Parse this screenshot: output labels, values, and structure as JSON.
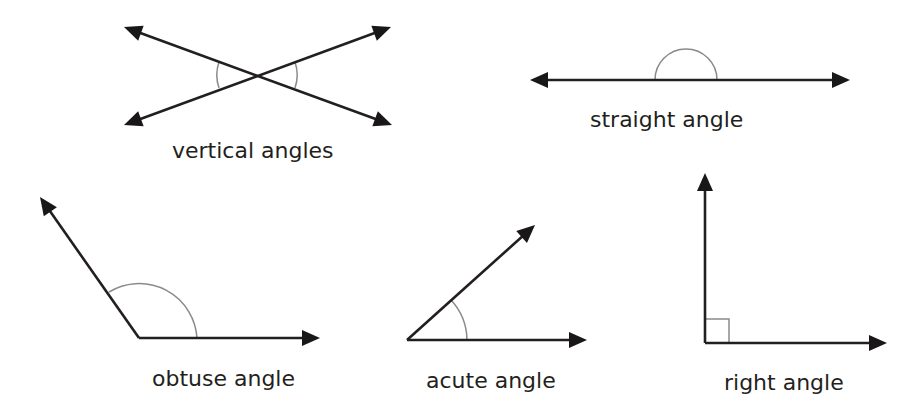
{
  "colors": {
    "line": "#231f20",
    "arrowhead": "#1a1718",
    "angle_marker": "#8a8a8a",
    "label": "#231f20",
    "background": "#ffffff"
  },
  "figures": [
    {
      "id": "vertical",
      "label": "vertical angles",
      "label_pos": [
        172,
        140
      ],
      "lines": [
        {
          "from": [
            124,
            27
          ],
          "to": [
            392,
            125
          ],
          "arrow_start": true,
          "arrow_end": true
        },
        {
          "from": [
            124,
            125
          ],
          "to": [
            391,
            27
          ],
          "arrow_start": true,
          "arrow_end": true
        }
      ],
      "vertex": [
        257,
        75
      ],
      "markers": [
        {
          "type": "arc",
          "path": "M 219 62 A 40 40 0 0 0 219 88"
        },
        {
          "type": "arc",
          "path": "M 295 62 A 40 40 0 0 1 295 88"
        }
      ]
    },
    {
      "id": "straight",
      "label": "straight angle",
      "label_pos": [
        590,
        109
      ],
      "lines": [
        {
          "from": [
            530,
            80
          ],
          "to": [
            850,
            80
          ],
          "arrow_start": true,
          "arrow_end": true
        }
      ],
      "vertex": [
        686,
        80
      ],
      "markers": [
        {
          "type": "arc",
          "path": "M 655 80 A 31 31 0 0 1 717 80"
        }
      ]
    },
    {
      "id": "obtuse",
      "label": "obtuse angle",
      "label_pos": [
        152,
        368
      ],
      "lines": [
        {
          "from": [
            139,
            338
          ],
          "to": [
            40,
            197
          ],
          "arrow_start": false,
          "arrow_end": true
        },
        {
          "from": [
            139,
            338
          ],
          "to": [
            320,
            338
          ],
          "arrow_start": false,
          "arrow_end": true
        }
      ],
      "vertex": [
        139,
        338
      ],
      "markers": [
        {
          "type": "arc",
          "path": "M 109 292 A 58 58 0 0 1 197 338"
        }
      ]
    },
    {
      "id": "acute",
      "label": "acute angle",
      "label_pos": [
        426,
        370
      ],
      "lines": [
        {
          "from": [
            407,
            340
          ],
          "to": [
            535,
            225
          ],
          "arrow_start": false,
          "arrow_end": true
        },
        {
          "from": [
            407,
            340
          ],
          "to": [
            587,
            340
          ],
          "arrow_start": false,
          "arrow_end": true
        }
      ],
      "vertex": [
        407,
        340
      ],
      "markers": [
        {
          "type": "arc",
          "path": "M 451 300 A 60 60 0 0 1 467 340"
        }
      ]
    },
    {
      "id": "right",
      "label": "right angle",
      "label_pos": [
        724,
        372
      ],
      "lines": [
        {
          "from": [
            705,
            343
          ],
          "to": [
            705,
            173
          ],
          "arrow_start": false,
          "arrow_end": true
        },
        {
          "from": [
            705,
            343
          ],
          "to": [
            887,
            343
          ],
          "arrow_start": false,
          "arrow_end": true
        }
      ],
      "vertex": [
        705,
        343
      ],
      "markers": [
        {
          "type": "square",
          "path": "M 705 319 L 729 319 L 729 343"
        }
      ]
    }
  ]
}
